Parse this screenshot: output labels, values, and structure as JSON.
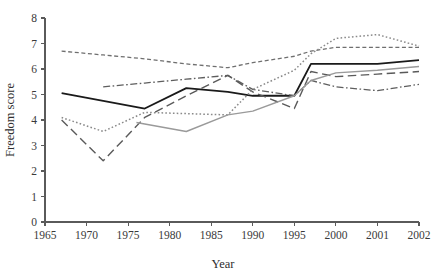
{
  "chart_data": {
    "type": "line",
    "title": "",
    "xlabel": "Year",
    "ylabel": "Freedom score",
    "grid": false,
    "legend": "none",
    "ylim": [
      0,
      8
    ],
    "yticks": [
      "0",
      "1",
      "2",
      "3",
      "4",
      "5",
      "6",
      "7",
      "8"
    ],
    "xticks": [
      "1965",
      "1970",
      "1975",
      "1980",
      "1985",
      "1990",
      "1995",
      "2000",
      "2001",
      "2002"
    ],
    "x_axis_note": "Tick labels are evenly spaced slots; final three labels 2000, 2001, 2002 are single-year steps",
    "series": [
      {
        "name": "series-solid-black",
        "style": "solid",
        "color": "#1a1a1a",
        "width": 1.8,
        "points": [
          {
            "x": "1967",
            "y": 5.05
          },
          {
            "x": "1972",
            "y": 4.75
          },
          {
            "x": "1977",
            "y": 4.45
          },
          {
            "x": "1982",
            "y": 5.25
          },
          {
            "x": "1987",
            "y": 5.1
          },
          {
            "x": "1990",
            "y": 4.95
          },
          {
            "x": "1995",
            "y": 4.95
          },
          {
            "x": "1997",
            "y": 6.2
          },
          {
            "x": "2000",
            "y": 6.2
          },
          {
            "x": "2001",
            "y": 6.2
          },
          {
            "x": "2002",
            "y": 6.35
          }
        ]
      },
      {
        "name": "series-short-dashed",
        "style": "dashed",
        "color": "#6f6f6f",
        "width": 1.3,
        "points": [
          {
            "x": "1967",
            "y": 6.7
          },
          {
            "x": "1972",
            "y": 6.55
          },
          {
            "x": "1977",
            "y": 6.4
          },
          {
            "x": "1982",
            "y": 6.2
          },
          {
            "x": "1987",
            "y": 6.05
          },
          {
            "x": "1990",
            "y": 6.25
          },
          {
            "x": "1995",
            "y": 6.5
          },
          {
            "x": "1997",
            "y": 6.7
          },
          {
            "x": "2000",
            "y": 6.85
          },
          {
            "x": "2001",
            "y": 6.85
          },
          {
            "x": "2002",
            "y": 6.85
          }
        ]
      },
      {
        "name": "series-dash-dot",
        "style": "dash-dot",
        "color": "#5e5e5e",
        "width": 1.3,
        "points": [
          {
            "x": "1972",
            "y": 5.3
          },
          {
            "x": "1977",
            "y": 5.45
          },
          {
            "x": "1982",
            "y": 5.6
          },
          {
            "x": "1987",
            "y": 5.75
          },
          {
            "x": "1990",
            "y": 5.2
          },
          {
            "x": "1995",
            "y": 4.95
          },
          {
            "x": "1997",
            "y": 5.55
          },
          {
            "x": "2000",
            "y": 5.3
          },
          {
            "x": "2001",
            "y": 5.15
          },
          {
            "x": "2002",
            "y": 5.4
          }
        ]
      },
      {
        "name": "series-long-dashed",
        "style": "long-dashed",
        "color": "#5a5a5a",
        "width": 1.4,
        "points": [
          {
            "x": "1967",
            "y": 4.0
          },
          {
            "x": "1972",
            "y": 2.4
          },
          {
            "x": "1977",
            "y": 4.1
          },
          {
            "x": "1982",
            "y": 4.95
          },
          {
            "x": "1987",
            "y": 5.75
          },
          {
            "x": "1990",
            "y": 5.1
          },
          {
            "x": "1995",
            "y": 4.45
          },
          {
            "x": "1997",
            "y": 5.9
          },
          {
            "x": "2000",
            "y": 5.7
          },
          {
            "x": "2001",
            "y": 5.8
          },
          {
            "x": "2002",
            "y": 5.9
          }
        ]
      },
      {
        "name": "series-dotted",
        "style": "dotted",
        "color": "#8a8a8a",
        "width": 1.5,
        "points": [
          {
            "x": "1967",
            "y": 4.1
          },
          {
            "x": "1972",
            "y": 3.55
          },
          {
            "x": "1977",
            "y": 4.3
          },
          {
            "x": "1982",
            "y": 4.25
          },
          {
            "x": "1987",
            "y": 4.2
          },
          {
            "x": "1990",
            "y": 5.2
          },
          {
            "x": "1995",
            "y": 5.95
          },
          {
            "x": "1997",
            "y": 6.6
          },
          {
            "x": "2000",
            "y": 7.2
          },
          {
            "x": "2001",
            "y": 7.35
          },
          {
            "x": "2002",
            "y": 6.9
          }
        ]
      },
      {
        "name": "series-solid-gray",
        "style": "solid",
        "color": "#9a9a9a",
        "width": 1.4,
        "points": [
          {
            "x": "1976",
            "y": 3.9
          },
          {
            "x": "1982",
            "y": 3.55
          },
          {
            "x": "1987",
            "y": 4.2
          },
          {
            "x": "1990",
            "y": 4.35
          },
          {
            "x": "1995",
            "y": 4.95
          },
          {
            "x": "1997",
            "y": 5.55
          },
          {
            "x": "2000",
            "y": 5.85
          },
          {
            "x": "2001",
            "y": 5.95
          },
          {
            "x": "2002",
            "y": 6.1
          }
        ]
      }
    ]
  }
}
